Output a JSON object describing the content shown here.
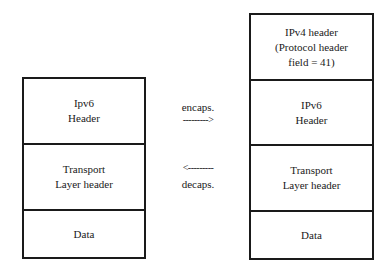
{
  "left_stack": {
    "cells": [
      {
        "lines": [
          "Ipv6",
          "Header"
        ]
      },
      {
        "lines": [
          "Transport",
          "Layer header"
        ]
      },
      {
        "lines": [
          "Data"
        ]
      }
    ]
  },
  "right_stack": {
    "cells": [
      {
        "lines": [
          "IPv4 header",
          "(Protocol header",
          "field = 41)"
        ]
      },
      {
        "lines": [
          "IPv6",
          "Header"
        ]
      },
      {
        "lines": [
          "Transport",
          "Layer header"
        ]
      },
      {
        "lines": [
          "Data"
        ]
      }
    ]
  },
  "encaps": {
    "label": "encaps.",
    "arrow": "--------->"
  },
  "decaps": {
    "label": "decaps.",
    "arrow": "<---------"
  }
}
